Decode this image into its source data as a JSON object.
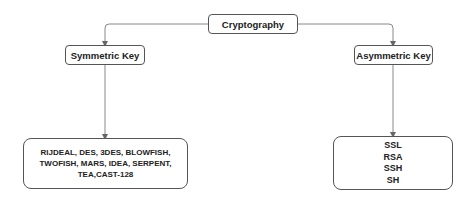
{
  "diagram": {
    "root": {
      "label": "Cryptography"
    },
    "branches": [
      {
        "label": "Symmetric Key",
        "leaf_lines": [
          "RIJDEAL, DES, 3DES, BLOWFISH,",
          "TWOFISH, MARS, IDEA, SERPENT,",
          "TEA,CAST-128"
        ]
      },
      {
        "label": "Asymmetric Key",
        "leaf_lines": [
          "SSL",
          "RSA",
          "SSH",
          "SH"
        ]
      }
    ],
    "colors": {
      "line": "#666666",
      "border": "#555555",
      "text": "#222222"
    }
  }
}
